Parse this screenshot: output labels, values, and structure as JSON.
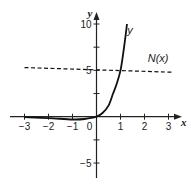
{
  "chart_data": {
    "type": "line",
    "title": "",
    "xlabel": "x",
    "ylabel": "y",
    "xlim": [
      -3,
      3
    ],
    "ylim": [
      -6,
      10
    ],
    "x_ticks": [
      -3,
      -2,
      -1,
      0,
      1,
      2,
      3
    ],
    "x_tick_labels": [
      "−3",
      "−2",
      "−1",
      "0",
      "1",
      "2",
      "3"
    ],
    "y_ticks": [
      -5,
      -2.5,
      2.5,
      5,
      7.5,
      10
    ],
    "y_tick_labels": {
      "10": "10",
      "5": "5",
      "-5": "−5"
    },
    "grid": false,
    "legend": false,
    "series": [
      {
        "name": "y",
        "style": "solid",
        "color": "#111111",
        "x": [
          -3,
          -2,
          -1,
          -0.5,
          0,
          0.25,
          0.5,
          0.69,
          0.85,
          1.0,
          1.1,
          1.2,
          1.27
        ],
        "y": [
          -0.05,
          -0.15,
          -0.3,
          -0.25,
          0,
          0.4,
          1.2,
          2.5,
          3.6,
          5,
          6.6,
          8.5,
          10
        ]
      },
      {
        "name": "N(x)",
        "style": "dashed",
        "color": "#111111",
        "x": [
          -3,
          3
        ],
        "y": [
          5.3,
          4.8
        ]
      }
    ],
    "annotations": [
      {
        "text": "y",
        "x": 1.45,
        "y": 9.3
      },
      {
        "text": "N(x)",
        "x": 2.3,
        "y": 6.3
      }
    ]
  }
}
